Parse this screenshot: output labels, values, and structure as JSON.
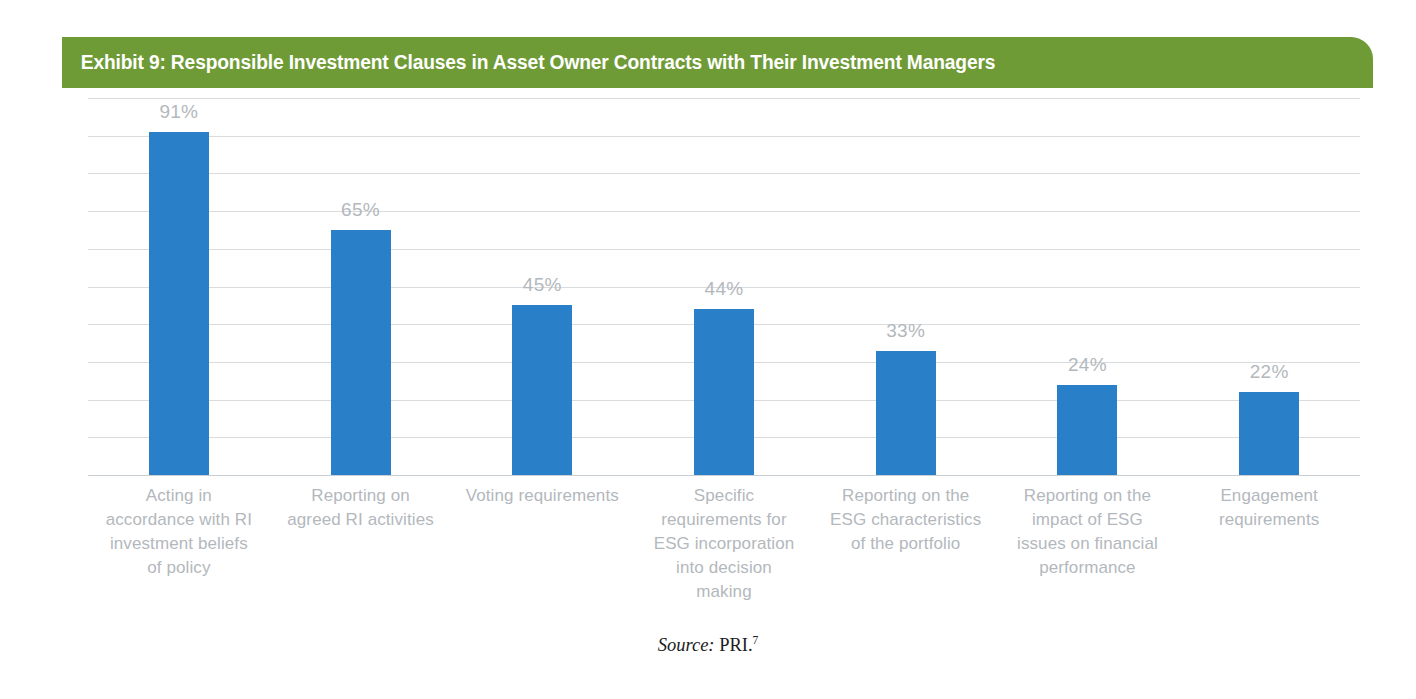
{
  "exhibit": {
    "title": "Exhibit 9: Responsible Investment Clauses in Asset Owner Contracts with Their Investment Managers",
    "banner_color": "#6E9B35",
    "bar_color": "#2A80C8",
    "label_color": "#B3B8BD",
    "gridline_color": "#D9DCDF"
  },
  "source": {
    "prefix": "Source:",
    "body": " PRI.",
    "footnote": "7"
  },
  "chart_data": {
    "type": "bar",
    "title": "Exhibit 9: Responsible Investment Clauses in Asset Owner Contracts with Their Investment Managers",
    "xlabel": "",
    "ylabel": "",
    "ylim": [
      0,
      100
    ],
    "grid": true,
    "gridline_interval": 10,
    "legend": "none",
    "value_suffix": "%",
    "categories": [
      "Acting in accordance with RI investment beliefs of policy",
      "Reporting on agreed RI activities",
      "Voting requirements",
      "Specific requirements for ESG incorporation into decision making",
      "Reporting on the ESG characteristics of the portfolio",
      "Reporting on the impact of ESG issues on financial performance",
      "Engagement requirements"
    ],
    "values": [
      91,
      65,
      45,
      44,
      33,
      24,
      22
    ],
    "data_labels": [
      "91%",
      "65%",
      "45%",
      "44%",
      "33%",
      "24%",
      "22%"
    ]
  }
}
